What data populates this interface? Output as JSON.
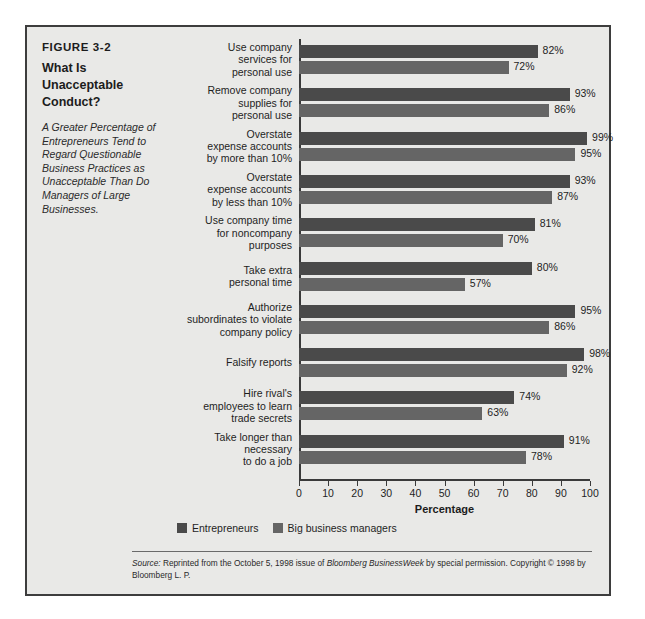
{
  "figure": {
    "number": "FIGURE 3-2",
    "title": "What Is Unacceptable Conduct?",
    "subtitle": "A Greater Percentage of Entrepreneurs Tend to Regard Questionable Business Practices as Unacceptable Than Do Managers of Large Businesses."
  },
  "source": {
    "prefix": "Source:",
    "text_1": " Reprinted from the October 5, 1998 issue of ",
    "publication": "Bloomberg BusinessWeek",
    "text_2": " by special permission. Copyright © 1998 by Bloomberg L. P."
  },
  "chart_data": {
    "type": "bar",
    "orientation": "horizontal",
    "title": "What Is Unacceptable Conduct?",
    "xlabel": "Percentage",
    "ylabel": "",
    "xlim": [
      0,
      100
    ],
    "xticks": [
      0,
      10,
      20,
      30,
      40,
      50,
      60,
      70,
      80,
      90,
      100
    ],
    "grid": false,
    "legend_position": "bottom-left",
    "value_suffix": "%",
    "categories": [
      "Use company services for personal use",
      "Remove company supplies for personal use",
      "Overstate expense accounts by more than 10%",
      "Overstate expense accounts by less than 10%",
      "Use company time for noncompany purposes",
      "Take extra personal time",
      "Authorize subordinates to violate company policy",
      "Falsify reports",
      "Hire rival's employees to learn trade secrets",
      "Take longer than necessary to do a job"
    ],
    "category_lines": [
      [
        "Use company",
        "services for",
        "personal use"
      ],
      [
        "Remove company",
        "supplies for",
        "personal use"
      ],
      [
        "Overstate",
        "expense accounts",
        "by more than 10%"
      ],
      [
        "Overstate",
        "expense accounts",
        "by less than 10%"
      ],
      [
        "Use company time",
        "for noncompany",
        "purposes"
      ],
      [
        "Take extra",
        "personal time"
      ],
      [
        "Authorize",
        "subordinates to violate",
        "company policy"
      ],
      [
        "Falsify reports"
      ],
      [
        "Hire rival's",
        "employees to learn",
        "trade secrets"
      ],
      [
        "Take longer than",
        "necessary",
        "to do a job"
      ]
    ],
    "series": [
      {
        "name": "Entrepreneurs",
        "color": "#4a4a4a",
        "values": [
          82,
          93,
          99,
          93,
          81,
          80,
          95,
          98,
          74,
          91
        ],
        "labels": [
          "82%",
          "93%",
          "99%",
          "93%",
          "81%",
          "80%",
          "95%",
          "98%",
          "74%",
          "91%"
        ]
      },
      {
        "name": "Big business managers",
        "color": "#656565",
        "values": [
          72,
          86,
          95,
          87,
          70,
          57,
          86,
          92,
          63,
          78
        ],
        "labels": [
          "72%",
          "86%",
          "95%",
          "87%",
          "70%",
          "57%",
          "86%",
          "92%",
          "63%",
          "78%"
        ]
      }
    ]
  }
}
